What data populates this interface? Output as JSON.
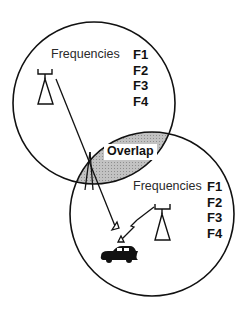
{
  "diagram": {
    "cells": [
      {
        "id": "cell-1",
        "label": "Frequencies",
        "frequencies": [
          "F1",
          "F2",
          "F3",
          "F4"
        ]
      },
      {
        "id": "cell-2",
        "label": "Frequencies",
        "frequencies": [
          "F1",
          "F2",
          "F3",
          "F4"
        ]
      }
    ],
    "overlap_label": "Overlap",
    "colors": {
      "line": "#111111",
      "overlap_fill": "#b9b9b9",
      "background": "#ffffff"
    },
    "icons": [
      "antenna-tower-icon",
      "antenna-tower-icon",
      "car-icon",
      "lightning-bolt-icon"
    ]
  }
}
